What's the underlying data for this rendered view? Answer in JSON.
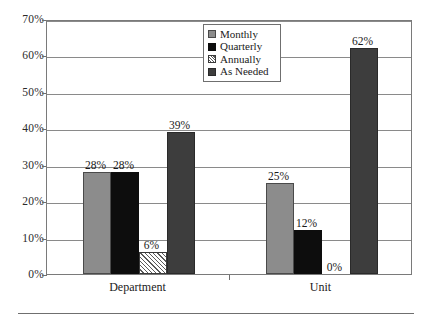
{
  "chart_data": {
    "type": "bar",
    "title": "",
    "xlabel": "",
    "ylabel": "",
    "ylim": [
      0,
      70
    ],
    "ytick_labels": [
      "0%",
      "10%",
      "20%",
      "30%",
      "40%",
      "50%",
      "60%",
      "70%"
    ],
    "ytick_values": [
      0,
      10,
      20,
      30,
      40,
      50,
      60,
      70
    ],
    "grid": true,
    "legend_position": "top-center",
    "categories": [
      "Department",
      "Unit"
    ],
    "series": [
      {
        "name": "Monthly",
        "values": [
          28,
          25
        ],
        "labels": [
          "28%",
          "25%"
        ],
        "color": "#8c8c8c",
        "pattern": "solid"
      },
      {
        "name": "Quarterly",
        "values": [
          28,
          12
        ],
        "labels": [
          "28%",
          "12%"
        ],
        "color": "#0d0d0d",
        "pattern": "solid"
      },
      {
        "name": "Annually",
        "values": [
          6,
          0
        ],
        "labels": [
          "6%",
          "0%"
        ],
        "color": "#ffffff",
        "pattern": "diagonal-hatch"
      },
      {
        "name": "As Needed",
        "values": [
          39,
          62
        ],
        "labels": [
          "39%",
          "62%"
        ],
        "color": "#3d3d3d",
        "pattern": "solid"
      }
    ]
  },
  "legend": {
    "items": [
      {
        "label": "Monthly"
      },
      {
        "label": "Quarterly"
      },
      {
        "label": "Annually"
      },
      {
        "label": "As Needed"
      }
    ]
  }
}
